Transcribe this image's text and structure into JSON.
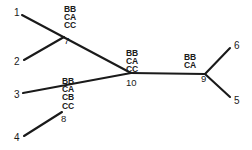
{
  "figure": {
    "type": "phylogenetic-tree-diagram",
    "background_color": "#ffffff",
    "line_color": "#1a1a1a",
    "text_color": "#1a1a1a"
  },
  "tips": [
    {
      "id": "tip-1",
      "label": "1",
      "x": 14,
      "y": 13
    },
    {
      "id": "tip-2",
      "label": "2",
      "x": 14,
      "y": 62
    },
    {
      "id": "tip-3",
      "label": "3",
      "x": 14,
      "y": 95
    },
    {
      "id": "tip-4",
      "label": "4",
      "x": 14,
      "y": 138
    },
    {
      "id": "tip-5",
      "label": "5",
      "x": 234,
      "y": 101
    },
    {
      "id": "tip-6",
      "label": "6",
      "x": 234,
      "y": 46
    }
  ],
  "nodes": [
    {
      "id": "node-7",
      "label": "7",
      "x": 64,
      "y": 41,
      "mutations": [
        "BB",
        "CA",
        "CC"
      ]
    },
    {
      "id": "node-8",
      "label": "8",
      "x": 62,
      "y": 119,
      "mutations": [
        "BB",
        "CA",
        "CB",
        "CC"
      ]
    },
    {
      "id": "node-9",
      "label": "9",
      "x": 203,
      "y": 79,
      "mutations": [
        "BB",
        "CA"
      ]
    },
    {
      "id": "node-10",
      "label": "10",
      "x": 128,
      "y": 83,
      "mutations": [
        "BB",
        "CA",
        "CC"
      ]
    }
  ],
  "mutation_stacks": [
    {
      "id": "stack-7",
      "node": "7",
      "x": 64,
      "y": 6,
      "values": [
        "BB",
        "CA",
        "CC"
      ]
    },
    {
      "id": "stack-8",
      "node": "8",
      "x": 62,
      "y": 78,
      "values": [
        "BB",
        "CA",
        "CB",
        "CC"
      ]
    },
    {
      "id": "stack-9",
      "node": "9",
      "x": 183,
      "y": 54,
      "values": [
        "BB",
        "CA"
      ]
    },
    {
      "id": "stack-10",
      "node": "10",
      "x": 126,
      "y": 50,
      "values": [
        "BB",
        "CA",
        "CC"
      ]
    }
  ],
  "edges": [
    {
      "id": "edge-1-7",
      "from": "1",
      "to": "7",
      "path": "M 22,15 L 131,73"
    },
    {
      "id": "edge-2-7",
      "from": "2",
      "to": "7",
      "path": "M 24,60 L 64,37"
    },
    {
      "id": "edge-3-8",
      "from": "3",
      "to": "8",
      "path": "M 23,93 L 131,73"
    },
    {
      "id": "edge-4-8",
      "from": "4",
      "to": "8",
      "path": "M 24,136 L 62,112"
    },
    {
      "id": "edge-10-9",
      "from": "10",
      "to": "9",
      "path": "M 131,73 L 205,74"
    },
    {
      "id": "edge-9-6",
      "from": "9",
      "to": "6",
      "path": "M 205,74 L 230,48"
    },
    {
      "id": "edge-9-5",
      "from": "9",
      "to": "5",
      "path": "M 205,74 L 230,97"
    }
  ]
}
